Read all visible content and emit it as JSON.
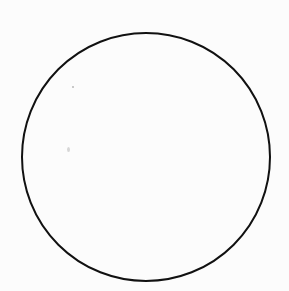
{
  "diagram": {
    "background_color": "#fcfcfc",
    "shapes": [
      {
        "type": "circle",
        "cx": 146,
        "cy": 157,
        "r": 124,
        "stroke": "#111111",
        "stroke_width": 2,
        "fill": "none"
      }
    ],
    "labels": []
  }
}
